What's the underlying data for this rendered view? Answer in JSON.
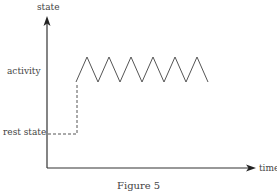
{
  "diagram": {
    "caption": "Figure 5",
    "y_axis_label": "state",
    "x_axis_label": "time",
    "levels": [
      {
        "label": "activity"
      },
      {
        "label": "rest state"
      }
    ],
    "colors": {
      "axis": "#222222",
      "line": "#555555"
    }
  }
}
